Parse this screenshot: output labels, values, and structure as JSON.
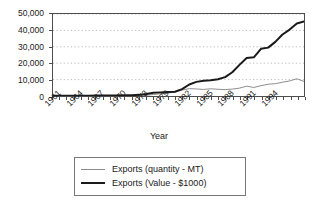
{
  "chart_data": {
    "type": "line",
    "title": "",
    "xlabel": "Year",
    "ylabel": "",
    "grid": true,
    "grid_axis": "y",
    "legend_position": "bottom",
    "xlim": [
      1961,
      1996
    ],
    "ylim": [
      0,
      50000
    ],
    "y_ticks": [
      0,
      10000,
      20000,
      30000,
      40000,
      50000
    ],
    "y_tick_labels": [
      "0",
      "10,000",
      "20,000",
      "30,000",
      "40,000",
      "50,000"
    ],
    "x": [
      1961,
      1962,
      1963,
      1964,
      1965,
      1966,
      1967,
      1968,
      1969,
      1970,
      1971,
      1972,
      1973,
      1974,
      1975,
      1976,
      1977,
      1978,
      1979,
      1980,
      1981,
      1982,
      1983,
      1984,
      1985,
      1986,
      1987,
      1988,
      1989,
      1990,
      1991,
      1992,
      1993,
      1994,
      1995,
      1996
    ],
    "x_tick_labels": [
      "1961",
      "1964",
      "1967",
      "1970",
      "1973",
      "1979",
      "1982",
      "1985",
      "1988",
      "1991",
      "1994"
    ],
    "x_tick_label_positions": [
      1961,
      1964,
      1967,
      1970,
      1973,
      1976,
      1979,
      1982,
      1985,
      1988,
      1991
    ],
    "series": [
      {
        "name": "Exports (quantity - MT)",
        "color": "#8c8c8c",
        "width": 1,
        "values": [
          120,
          130,
          140,
          150,
          160,
          170,
          180,
          200,
          220,
          240,
          260,
          300,
          350,
          500,
          900,
          1400,
          1800,
          2400,
          3600,
          4500,
          4300,
          4000,
          4400,
          4100,
          3900,
          4200,
          4800,
          6000,
          5200,
          6300,
          7200,
          7500,
          8400,
          9200,
          10500,
          8900
        ]
      },
      {
        "name": "Exports (Value - $1000)",
        "color": "#1a1a1a",
        "width": 2,
        "values": [
          150,
          160,
          170,
          190,
          210,
          230,
          250,
          280,
          320,
          360,
          400,
          500,
          700,
          1200,
          2000,
          2200,
          2400,
          2600,
          4200,
          7000,
          8600,
          9300,
          9600,
          10200,
          11500,
          14500,
          19000,
          23200,
          23600,
          28800,
          29500,
          33000,
          37500,
          40500,
          44200,
          45500
        ]
      }
    ]
  },
  "axis": {
    "x_title": "Year"
  },
  "legend": {
    "items": [
      {
        "label": "Exports (quantity - MT)"
      },
      {
        "label": "Exports (Value - $1000)"
      }
    ]
  }
}
